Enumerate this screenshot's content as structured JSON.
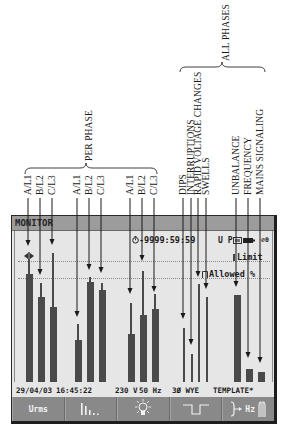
{
  "annotations": {
    "per_phase": "PER PHASE",
    "all_phases": "ALL PHASES",
    "labels": [
      {
        "text": "A/L1"
      },
      {
        "text": "B/L2"
      },
      {
        "text": "C/L3"
      },
      {
        "text": "A/L1"
      },
      {
        "text": "B/L2"
      },
      {
        "text": "C/L3"
      },
      {
        "text": "A/L1"
      },
      {
        "text": "B/L2"
      },
      {
        "text": "C/L3"
      },
      {
        "text": "DIPS"
      },
      {
        "text": "INTERRUPTIONS"
      },
      {
        "text": "RAPID VOLTAGE CHANGES"
      },
      {
        "text": "SWELLS"
      },
      {
        "text": "UNBALANCE"
      },
      {
        "text": "FREQUENCY"
      },
      {
        "text": "MAINS SIGNALING"
      }
    ]
  },
  "screen": {
    "title": "MONITOR",
    "timer": "-9999:59:59",
    "mode_indicator": "U P",
    "extra_indicator": "⌀0",
    "limit_label": "Limit",
    "allowed_label": "Allowed %",
    "bars": [
      {
        "label": "A/L1",
        "value": 89,
        "max": 102
      },
      {
        "label": "B/L2",
        "value": 70,
        "max": 82
      },
      {
        "label": "C/L3",
        "value": 62,
        "max": 107
      },
      {
        "label": "A/L1",
        "value": 35,
        "max": 48
      },
      {
        "label": "B/L2",
        "value": 83,
        "max": 87
      },
      {
        "label": "C/L3",
        "value": 76,
        "max": 82
      },
      {
        "label": "A/L1",
        "value": 40,
        "max": 65
      },
      {
        "label": "B/L2",
        "value": 55,
        "max": 92
      },
      {
        "label": "C/L3",
        "value": 60,
        "max": 73
      },
      {
        "label": "DIPS",
        "value": null,
        "max": 45
      },
      {
        "label": "INTERRUPTIONS",
        "value": null,
        "max": 23
      },
      {
        "label": "RAPID VOLTAGE CHANGES",
        "value": null,
        "max": 81
      },
      {
        "label": "SWELLS",
        "value": null,
        "max": 70
      },
      {
        "label": "UNBALANCE",
        "value": 72,
        "max": null
      },
      {
        "label": "FREQUENCY",
        "value": 11,
        "max": null
      },
      {
        "label": "MAINS SIGNALING",
        "value": 8,
        "max": null
      }
    ],
    "status": {
      "date": "29/04/03",
      "time": "16:45:22",
      "voltage": "230 V",
      "frequency": "50 Hz",
      "config": "3Ø WYE",
      "template": "TEMPLATE*"
    },
    "softkeys": [
      {
        "label": "Urms",
        "icon": null
      },
      {
        "label": null,
        "icon": "harmonics-bars-icon"
      },
      {
        "label": null,
        "icon": "flicker-lightbulb-icon"
      },
      {
        "label": null,
        "icon": "dips-pulse-icon"
      },
      {
        "label": "Hz",
        "icon": "unbalance-arrow-icon+mains-signaling-icon"
      }
    ]
  },
  "colors": {
    "screen_bg": "#e6e6e6",
    "header_bg": "#9c9c9c",
    "bar": "#4a4a4a",
    "softkey_bg": "#898989",
    "annotation_ink": "#1a1a1a"
  }
}
